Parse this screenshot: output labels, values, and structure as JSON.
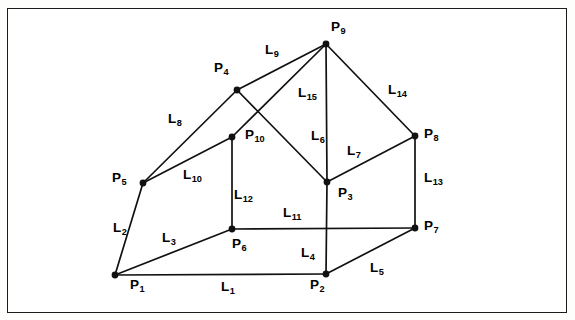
{
  "figure": {
    "type": "line-drawing",
    "background_color": "#ffffff",
    "line_color": "#111111",
    "frame": {
      "x": 7,
      "y": 8,
      "width": 560,
      "height": 305,
      "border_color": "#1b1b1b"
    }
  },
  "vertices": [
    {
      "id": "P1",
      "label": "P",
      "sub": "1",
      "x": 115,
      "y": 275,
      "label_x": 130,
      "label_y": 278
    },
    {
      "id": "P2",
      "label": "P",
      "sub": "2",
      "x": 326,
      "y": 274,
      "label_x": 310,
      "label_y": 278
    },
    {
      "id": "P3",
      "label": "P",
      "sub": "3",
      "x": 327,
      "y": 182,
      "label_x": 338,
      "label_y": 186
    },
    {
      "id": "P4",
      "label": "P",
      "sub": "4",
      "x": 237,
      "y": 90,
      "label_x": 214,
      "label_y": 61
    },
    {
      "id": "P5",
      "label": "P",
      "sub": "5",
      "x": 143,
      "y": 183,
      "label_x": 112,
      "label_y": 171
    },
    {
      "id": "P6",
      "label": "P",
      "sub": "6",
      "x": 232,
      "y": 229,
      "label_x": 232,
      "label_y": 237
    },
    {
      "id": "P7",
      "label": "P",
      "sub": "7",
      "x": 415,
      "y": 228,
      "label_x": 424,
      "label_y": 219
    },
    {
      "id": "P8",
      "label": "P",
      "sub": "8",
      "x": 415,
      "y": 136,
      "label_x": 424,
      "label_y": 127
    },
    {
      "id": "P9",
      "label": "P",
      "sub": "9",
      "x": 326,
      "y": 44,
      "label_x": 331,
      "label_y": 20
    },
    {
      "id": "P10",
      "label": "P",
      "sub": "10",
      "x": 232,
      "y": 137,
      "label_x": 245,
      "label_y": 128
    }
  ],
  "edges": [
    {
      "id": "L1",
      "label": "L",
      "sub": "1",
      "from": "P1",
      "to": "P2",
      "label_x": 221,
      "label_y": 280
    },
    {
      "id": "L2",
      "label": "L",
      "sub": "2",
      "from": "P5",
      "to": "P1",
      "label_x": 113,
      "label_y": 221
    },
    {
      "id": "L3",
      "label": "L",
      "sub": "3",
      "from": "P1",
      "to": "P6",
      "label_x": 162,
      "label_y": 231
    },
    {
      "id": "L4",
      "label": "L",
      "sub": "4",
      "from": "P2",
      "to": "P3",
      "label_x": 301,
      "label_y": 246
    },
    {
      "id": "L5",
      "label": "L",
      "sub": "5",
      "from": "P2",
      "to": "P7",
      "label_x": 370,
      "label_y": 261
    },
    {
      "id": "L6",
      "label": "L",
      "sub": "6",
      "from": "P9",
      "to": "P3",
      "label_x": 311,
      "label_y": 129
    },
    {
      "id": "L7",
      "label": "L",
      "sub": "7",
      "from": "P3",
      "to": "P8",
      "label_x": 347,
      "label_y": 144
    },
    {
      "id": "L8",
      "label": "L",
      "sub": "8",
      "from": "P5",
      "to": "P4",
      "label_x": 168,
      "label_y": 112
    },
    {
      "id": "L9",
      "label": "L",
      "sub": "9",
      "from": "P4",
      "to": "P9",
      "label_x": 265,
      "label_y": 43
    },
    {
      "id": "L10",
      "label": "L",
      "sub": "10",
      "from": "P5",
      "to": "P10",
      "label_x": 183,
      "label_y": 168
    },
    {
      "id": "L11",
      "label": "L",
      "sub": "11",
      "from": "P6",
      "to": "P7",
      "label_x": 283,
      "label_y": 206
    },
    {
      "id": "L12",
      "label": "L",
      "sub": "12",
      "from": "P10",
      "to": "P6",
      "label_x": 234,
      "label_y": 188
    },
    {
      "id": "L13",
      "label": "L",
      "sub": "13",
      "from": "P8",
      "to": "P7",
      "label_x": 424,
      "label_y": 171
    },
    {
      "id": "L14",
      "label": "L",
      "sub": "14",
      "from": "P9",
      "to": "P8",
      "label_x": 388,
      "label_y": 83
    },
    {
      "id": "L15",
      "label": "L",
      "sub": "15",
      "from": "P10",
      "to": "P9",
      "label_x": 298,
      "label_y": 86
    }
  ],
  "extra_edges": [
    {
      "id": "E-P4-P3",
      "from": "P4",
      "to": "P3"
    }
  ]
}
